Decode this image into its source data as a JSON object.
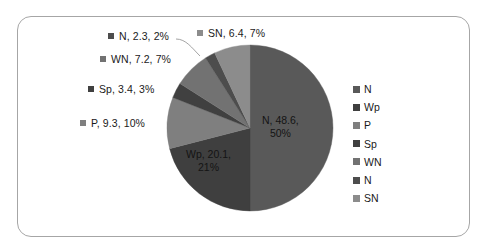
{
  "frame": {
    "border_color": "#a6a6a6",
    "background": "#ffffff"
  },
  "legend": {
    "position": "right",
    "items": [
      {
        "label": "N",
        "color": "#595959"
      },
      {
        "label": "Wp",
        "color": "#3f3f3f"
      },
      {
        "label": "P",
        "color": "#7f7f7f"
      },
      {
        "label": "Sp",
        "color": "#404040"
      },
      {
        "label": "WN",
        "color": "#727272"
      },
      {
        "label": "N",
        "color": "#4d4d4d"
      },
      {
        "label": "SN",
        "color": "#8c8c8c"
      }
    ]
  },
  "callout_labels": [
    {
      "name": "label-n-small",
      "text": "N, 2.3, 2%",
      "color": "#4d4d4d",
      "left": 108,
      "top": 30
    },
    {
      "name": "label-sn",
      "text": "SN, 6.4, 7%",
      "color": "#8c8c8c",
      "left": 197,
      "top": 27
    },
    {
      "name": "label-wn",
      "text": "WN, 7.2, 7%",
      "color": "#727272",
      "left": 100,
      "top": 53
    },
    {
      "name": "label-sp",
      "text": "Sp, 3.4, 3%",
      "color": "#404040",
      "left": 88,
      "top": 83
    },
    {
      "name": "label-p",
      "text": "P, 9.3, 10%",
      "color": "#7f7f7f",
      "left": 80,
      "top": 117
    }
  ],
  "inner_labels": [
    {
      "name": "label-n-large",
      "line1": "N, 48.6,",
      "line2": "50%",
      "left": 262,
      "top": 114
    },
    {
      "name": "label-wp",
      "line1": "Wp, 20.1,",
      "line2": "21%",
      "left": 186,
      "top": 148
    }
  ],
  "chart_data": {
    "type": "pie",
    "title": "",
    "categories": [
      "N",
      "Wp",
      "P",
      "Sp",
      "WN",
      "N",
      "SN"
    ],
    "values": [
      48.6,
      20.1,
      9.3,
      3.4,
      7.2,
      2.3,
      6.4
    ],
    "percentages": [
      50,
      21,
      10,
      3,
      7,
      2,
      7
    ],
    "data_labels": [
      "N, 48.6, 50%",
      "Wp, 20.1, 21%",
      "P, 9.3, 10%",
      "Sp, 3.4, 3%",
      "WN, 7.2, 7%",
      "N, 2.3, 2%",
      "SN, 6.4, 7%"
    ],
    "colors": [
      "#595959",
      "#3f3f3f",
      "#7f7f7f",
      "#404040",
      "#727272",
      "#4d4d4d",
      "#8c8c8c"
    ],
    "start_angle": 0,
    "direction": "clockwise",
    "legend_position": "right",
    "grid": false,
    "total": 97.3,
    "xlabel": "",
    "ylabel": ""
  },
  "geometry": {
    "center_x": 250,
    "center_y": 128,
    "radius": 83
  }
}
